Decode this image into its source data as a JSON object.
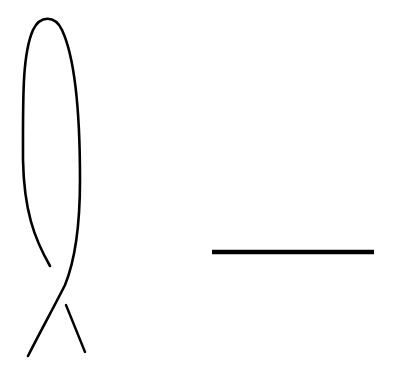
{
  "diagram": {
    "type": "knot-diagram",
    "stroke_color": "#000000",
    "background": "#ffffff",
    "elements": [
      {
        "name": "kinked-strand",
        "crossings": 1
      },
      {
        "name": "straight-strand",
        "orientation": "horizontal"
      }
    ]
  }
}
